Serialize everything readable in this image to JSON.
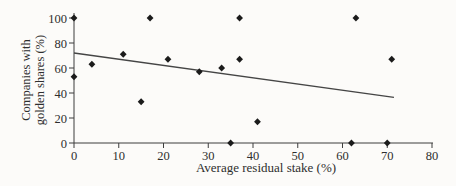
{
  "chart_data": {
    "type": "scatter",
    "title": "",
    "xlabel": "Average residual stake (%)",
    "ylabel": "Companies with golden shares (%)",
    "ylabel_line1": "Companies with",
    "ylabel_line2": "golden shares (%)",
    "xlim": [
      0,
      80
    ],
    "ylim": [
      0,
      100
    ],
    "x_ticks": [
      0,
      10,
      20,
      30,
      40,
      50,
      60,
      70,
      80
    ],
    "y_ticks": [
      0,
      20,
      40,
      60,
      80,
      100
    ],
    "grid": false,
    "legend": "none",
    "marker": "diamond",
    "points": [
      {
        "x": 0,
        "y": 100
      },
      {
        "x": 0,
        "y": 53
      },
      {
        "x": 4,
        "y": 63
      },
      {
        "x": 11,
        "y": 71
      },
      {
        "x": 15,
        "y": 33
      },
      {
        "x": 17,
        "y": 100
      },
      {
        "x": 21,
        "y": 67
      },
      {
        "x": 28,
        "y": 57
      },
      {
        "x": 33,
        "y": 60
      },
      {
        "x": 35,
        "y": 0
      },
      {
        "x": 37,
        "y": 100
      },
      {
        "x": 37,
        "y": 67
      },
      {
        "x": 41,
        "y": 17
      },
      {
        "x": 62,
        "y": 0
      },
      {
        "x": 63,
        "y": 100
      },
      {
        "x": 70,
        "y": 0
      },
      {
        "x": 71,
        "y": 67
      }
    ],
    "trendline": {
      "x1": 0,
      "y1": 72,
      "x2": 71.5,
      "y2": 36.5
    },
    "colors": {
      "marker": "#1b1b1b",
      "line": "#454545",
      "axis": "#3d3d3d",
      "text": "#2e2e2e",
      "background": "#fcfbf9"
    }
  }
}
